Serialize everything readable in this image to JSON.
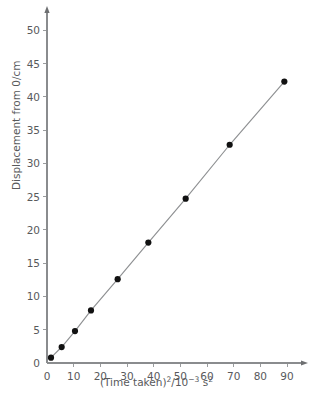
{
  "chart_data": {
    "type": "scatter",
    "title": "",
    "xlabel": "(Time taken)2/10-3 s2",
    "xlabel_parts": {
      "base": "(Time taken)",
      "base_exp": "2",
      "divider": "/10",
      "divider_exp": "−3",
      "unit": "s",
      "unit_exp": "2"
    },
    "ylabel": "Displacement from 0/cm",
    "xlim": [
      0,
      93
    ],
    "ylim": [
      0,
      52
    ],
    "xticks": [
      0,
      10,
      20,
      30,
      40,
      50,
      60,
      70,
      80,
      90
    ],
    "yticks": [
      0,
      5,
      10,
      15,
      20,
      25,
      30,
      35,
      40,
      45,
      50
    ],
    "grid": false,
    "legend": false,
    "marker": "filled-circle",
    "marker_color": "#111111",
    "line_color": "#8e9092",
    "axis_color": "#8a8c8e",
    "background": "#ffffff",
    "x": [
      1.5,
      5.5,
      10.5,
      16.5,
      26.5,
      38.0,
      52.0,
      68.5,
      89.0
    ],
    "y": [
      0.8,
      2.4,
      4.8,
      7.9,
      12.6,
      18.1,
      24.7,
      32.8,
      42.3
    ],
    "points": [
      {
        "x": 1.5,
        "y": 0.8
      },
      {
        "x": 5.5,
        "y": 2.4
      },
      {
        "x": 10.5,
        "y": 4.8
      },
      {
        "x": 16.5,
        "y": 7.9
      },
      {
        "x": 26.5,
        "y": 12.6
      },
      {
        "x": 38.0,
        "y": 18.1
      },
      {
        "x": 52.0,
        "y": 24.7
      },
      {
        "x": 68.5,
        "y": 32.8
      },
      {
        "x": 89.0,
        "y": 42.3
      }
    ]
  }
}
